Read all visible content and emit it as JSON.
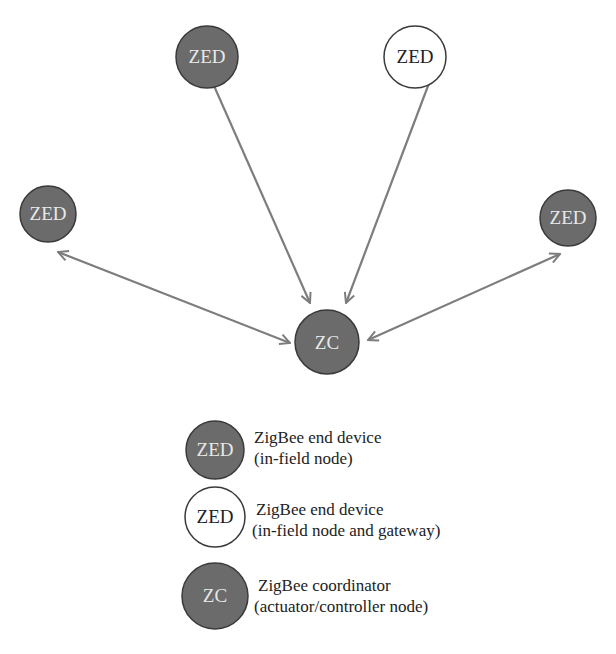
{
  "colors": {
    "dark_fill": "#6b6b6b",
    "light_fill": "#ffffff",
    "stroke": "#3a3a3a",
    "edge": "#7d7d7d",
    "dark_text": "#e8e8e8",
    "light_text": "#222222"
  },
  "diagram": {
    "nodes": [
      {
        "id": "zed_top_left",
        "label": "ZED",
        "type": "end_device"
      },
      {
        "id": "zed_top_right",
        "label": "ZED",
        "type": "gateway"
      },
      {
        "id": "zed_left",
        "label": "ZED",
        "type": "end_device"
      },
      {
        "id": "zed_right",
        "label": "ZED",
        "type": "end_device"
      },
      {
        "id": "zc_center",
        "label": "ZC",
        "type": "coordinator"
      }
    ],
    "edges": [
      {
        "from": "zed_top_left",
        "to": "zc_center",
        "direction": "both"
      },
      {
        "from": "zed_top_right",
        "to": "zc_center",
        "direction": "both"
      },
      {
        "from": "zed_left",
        "to": "zc_center",
        "direction": "both"
      },
      {
        "from": "zed_right",
        "to": "zc_center",
        "direction": "both"
      }
    ]
  },
  "legend": {
    "items": [
      {
        "symbol": "ZED",
        "line1": "ZigBee end device",
        "line2": "(in-field node)"
      },
      {
        "symbol": "ZED",
        "line1": "ZigBee end device",
        "line2": "(in-field node and gateway)"
      },
      {
        "symbol": "ZC",
        "line1": "ZigBee coordinator",
        "line2": "(actuator/controller node)"
      }
    ]
  }
}
